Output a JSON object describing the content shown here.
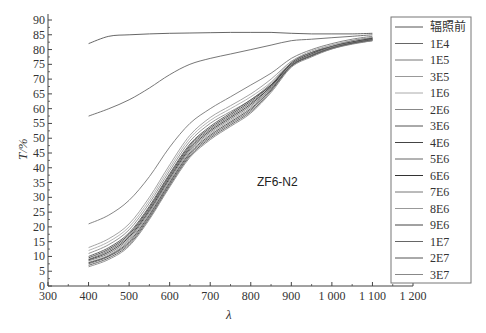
{
  "chart_data": {
    "type": "line",
    "title": "",
    "annotation": "ZF6-N2",
    "xlabel": "λ",
    "ylabel": "T/%",
    "xlim": [
      300,
      1200
    ],
    "ylim": [
      0,
      90
    ],
    "xticks": [
      300,
      400,
      500,
      600,
      700,
      800,
      900,
      1000,
      1100,
      1200
    ],
    "xtick_labels": [
      "300",
      "400",
      "500",
      "600",
      "700",
      "800",
      "900",
      "1 000",
      "1 100",
      "1 200"
    ],
    "yticks": [
      0,
      5,
      10,
      15,
      20,
      25,
      30,
      35,
      40,
      45,
      50,
      55,
      60,
      65,
      70,
      75,
      80,
      85,
      90
    ],
    "grid": false,
    "legend_position": "right-outside",
    "x": [
      400,
      450,
      500,
      550,
      600,
      650,
      700,
      750,
      800,
      850,
      900,
      950,
      1000,
      1050,
      1100
    ],
    "series": [
      {
        "name": "辐照前",
        "values": [
          82,
          84.5,
          85,
          85.3,
          85.5,
          85.6,
          85.7,
          85.8,
          85.8,
          85.8,
          85.5,
          85.3,
          85.3,
          85.3,
          85.5
        ]
      },
      {
        "name": "1E4",
        "values": [
          57.5,
          60,
          63,
          67,
          71.5,
          75,
          77,
          78.5,
          80,
          81.5,
          83,
          83.5,
          84,
          84.5,
          85
        ]
      },
      {
        "name": "1E5",
        "values": [
          21,
          24,
          29,
          37,
          47,
          55,
          60,
          64,
          68,
          72,
          77,
          80,
          82,
          83.5,
          84.5
        ]
      },
      {
        "name": "3E5",
        "values": [
          13,
          16,
          21,
          30,
          41,
          51,
          57,
          61,
          65,
          70,
          76,
          79.5,
          81.5,
          83,
          84
        ]
      },
      {
        "name": "1E6",
        "values": [
          12,
          15,
          20,
          29,
          40,
          50,
          56,
          60,
          64,
          69,
          76,
          79,
          81.5,
          83,
          84
        ]
      },
      {
        "name": "2E6",
        "values": [
          11,
          14,
          19,
          28,
          39,
          49,
          55,
          59,
          63,
          68.5,
          75.5,
          79,
          81,
          83,
          84
        ]
      },
      {
        "name": "3E6",
        "values": [
          10,
          13,
          18,
          27,
          38,
          48,
          54,
          58.5,
          63,
          68,
          75.5,
          79,
          81,
          82.5,
          83.8
        ]
      },
      {
        "name": "4E6",
        "values": [
          9.5,
          12.5,
          17.5,
          26.5,
          37.5,
          47.5,
          53.5,
          58,
          62.5,
          68,
          75,
          78.5,
          81,
          82.5,
          83.8
        ]
      },
      {
        "name": "5E6",
        "values": [
          9,
          12,
          17,
          26,
          37,
          47,
          53,
          57.5,
          62,
          67.5,
          75,
          78.5,
          81,
          82.5,
          83.5
        ]
      },
      {
        "name": "6E6",
        "values": [
          8.8,
          11.5,
          16.5,
          25.5,
          36.5,
          46.5,
          52.5,
          57,
          61.5,
          67.5,
          75,
          78.5,
          80.8,
          82.5,
          83.5
        ]
      },
      {
        "name": "7E6",
        "values": [
          8.5,
          11,
          16,
          25,
          36,
          46,
          52,
          56.5,
          61,
          67,
          74.8,
          78.3,
          80.8,
          82.3,
          83.5
        ]
      },
      {
        "name": "8E6",
        "values": [
          8,
          10.5,
          15.5,
          24.5,
          35.5,
          45.5,
          51.5,
          56,
          60.5,
          67,
          74.8,
          78.3,
          80.7,
          82.3,
          83.3
        ]
      },
      {
        "name": "9E6",
        "values": [
          7.8,
          10.2,
          15,
          24,
          35,
          45,
          51,
          55.5,
          60,
          66.5,
          74.5,
          78,
          80.5,
          82.2,
          83.3
        ]
      },
      {
        "name": "1E7",
        "values": [
          7.5,
          10,
          14.5,
          23.5,
          34.5,
          44.5,
          50.5,
          55,
          59.5,
          66.5,
          74.5,
          78,
          80.5,
          82,
          83.2
        ]
      },
      {
        "name": "2E7",
        "values": [
          7,
          9.5,
          14,
          23,
          34,
          44,
          50,
          54.5,
          59,
          66,
          74.3,
          77.8,
          80.3,
          82,
          83
        ]
      },
      {
        "name": "3E7",
        "values": [
          6.5,
          9,
          13.5,
          22.5,
          33.5,
          43.5,
          49.5,
          54,
          58.5,
          65.5,
          74,
          77.5,
          80.2,
          81.8,
          83
        ]
      }
    ]
  },
  "legend": {
    "items": [
      {
        "label": "辐照前"
      },
      {
        "label": "1E4"
      },
      {
        "label": "1E5"
      },
      {
        "label": "3E5"
      },
      {
        "label": "1E6"
      },
      {
        "label": "2E6"
      },
      {
        "label": "3E6"
      },
      {
        "label": "4E6"
      },
      {
        "label": "5E6"
      },
      {
        "label": "6E6"
      },
      {
        "label": "7E6"
      },
      {
        "label": "8E6"
      },
      {
        "label": "9E6"
      },
      {
        "label": "1E7"
      },
      {
        "label": "2E7"
      },
      {
        "label": "3E7"
      }
    ]
  },
  "colors": {
    "axis": "#444444",
    "legend_border": "#777777",
    "series_colors": [
      "#555555",
      "#666666",
      "#777777",
      "#999999",
      "#aaaaaa",
      "#888888",
      "#555555",
      "#444444",
      "#666666",
      "#333333",
      "#777777",
      "#999999",
      "#444444",
      "#666666",
      "#555555",
      "#888888"
    ]
  }
}
